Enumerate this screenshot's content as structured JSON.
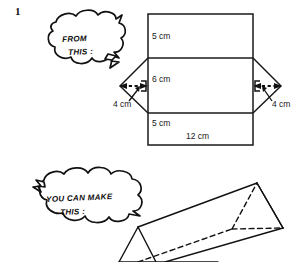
{
  "page": {
    "question_number": "1",
    "background_color": "#ffffff",
    "ink_color": "#111111"
  },
  "bubbles": [
    {
      "name": "from-this-bubble",
      "line1": "FROM",
      "line2": "THIS :"
    },
    {
      "name": "you-can-make-this-bubble",
      "line1": "YOU CAN MAKE",
      "line2": "THIS :"
    }
  ],
  "net_diagram": {
    "name": "triangular-prism-net",
    "labels": {
      "top_rect_height": "5 cm",
      "middle_rect_height": "6 cm",
      "bottom_rect_height": "5 cm",
      "width": "12 cm",
      "left_triangle_height": "4 cm",
      "right_triangle_height": "4 cm"
    }
  },
  "solid_diagram": {
    "name": "triangular-prism-solid",
    "description": "triangular prism"
  }
}
